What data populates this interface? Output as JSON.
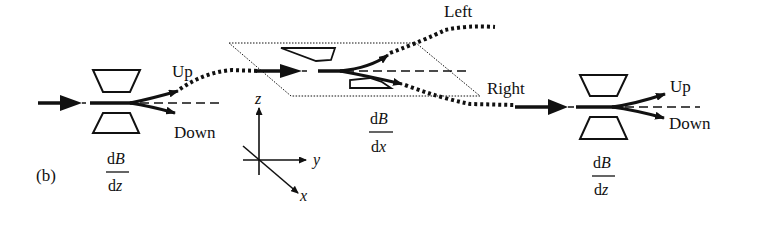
{
  "figure": {
    "panel_label": "(b)",
    "stages": [
      {
        "id": "stage1",
        "gradient_num": "dB",
        "gradient_num_d": "d",
        "gradient_num_var": "B",
        "gradient_den_d": "d",
        "gradient_den_var": "z",
        "outputs": [
          "Up",
          "Down"
        ]
      },
      {
        "id": "stage2",
        "gradient_num_d": "d",
        "gradient_num_var": "B",
        "gradient_den_d": "d",
        "gradient_den_var": "x",
        "outputs": [
          "Left",
          "Right"
        ]
      },
      {
        "id": "stage3",
        "gradient_num_d": "d",
        "gradient_num_var": "B",
        "gradient_den_d": "d",
        "gradient_den_var": "z",
        "outputs": [
          "Up",
          "Down"
        ]
      }
    ],
    "axes": {
      "z": "z",
      "y": "y",
      "x": "x"
    },
    "colors": {
      "ink": "#111111",
      "background": "#ffffff"
    }
  }
}
